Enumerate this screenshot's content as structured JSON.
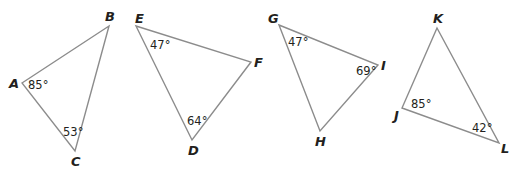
{
  "triangles": [
    {
      "name": "ABC",
      "vertices": {
        "A": "A",
        "B": "B",
        "C": "C"
      },
      "angles": {
        "A": "85°",
        "C": "53°"
      }
    },
    {
      "name": "EFD",
      "vertices": {
        "E": "E",
        "F": "F",
        "D": "D"
      },
      "angles": {
        "E": "47°",
        "D": "64°"
      }
    },
    {
      "name": "GIH",
      "vertices": {
        "G": "G",
        "I": "I",
        "H": "H"
      },
      "angles": {
        "G": "47°",
        "I": "69°"
      }
    },
    {
      "name": "KJL",
      "vertices": {
        "K": "K",
        "J": "J",
        "L": "L"
      },
      "angles": {
        "J": "85°",
        "L": "42°"
      }
    }
  ],
  "colors": {
    "edge": "#8c8c8c",
    "text": "#231f20",
    "background": "#ffffff"
  }
}
